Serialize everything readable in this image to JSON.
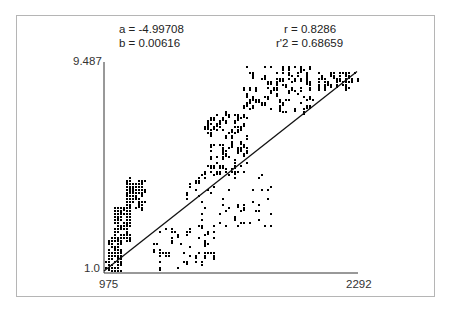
{
  "stats": {
    "a": "a = -4.99708",
    "b": "b = 0.00616",
    "r": "r = 0.8286",
    "r2": "r'2 = 0.68659"
  },
  "axes": {
    "y_max_label": "9.487",
    "y_min_label": "1.0",
    "x_min_label": "975",
    "x_max_label": "2292"
  },
  "colors": {
    "points": "#000000",
    "line": "#111111",
    "axis": "#333333",
    "frame": "#b5b5b5"
  },
  "chart_data": {
    "type": "scatter",
    "title": "",
    "xlabel": "",
    "ylabel": "",
    "xlim": [
      975,
      2292
    ],
    "ylim": [
      1.0,
      9.487
    ],
    "grid": false,
    "legend": null,
    "annotations": [
      "a = -4.99708",
      "b = 0.00616",
      "r = 0.8286",
      "r'2 = 0.68659"
    ],
    "regression": {
      "intercept": -4.99708,
      "slope": 0.00616,
      "r": 0.8286,
      "r_squared": 0.68659,
      "x": [
        975,
        2292
      ],
      "y": [
        1.0,
        9.1
      ]
    },
    "clusters": [
      {
        "x_range": [
          985,
          1060
        ],
        "y_range": [
          1.0,
          2.4
        ],
        "density": "high"
      },
      {
        "x_range": [
          1020,
          1110
        ],
        "y_range": [
          2.2,
          3.6
        ],
        "density": "high"
      },
      {
        "x_range": [
          1080,
          1180
        ],
        "y_range": [
          3.6,
          4.8
        ],
        "density": "high"
      },
      {
        "x_range": [
          1230,
          1560
        ],
        "y_range": [
          1.0,
          2.8
        ],
        "density": "medium"
      },
      {
        "x_range": [
          1400,
          1860
        ],
        "y_range": [
          2.8,
          5.0
        ],
        "density": "medium"
      },
      {
        "x_range": [
          1500,
          1720
        ],
        "y_range": [
          5.0,
          7.5
        ],
        "density": "high"
      },
      {
        "x_range": [
          1700,
          2060
        ],
        "y_range": [
          7.5,
          9.4
        ],
        "density": "high"
      },
      {
        "x_range": [
          2080,
          2290
        ],
        "y_range": [
          8.5,
          9.1
        ],
        "density": "medium"
      }
    ]
  }
}
